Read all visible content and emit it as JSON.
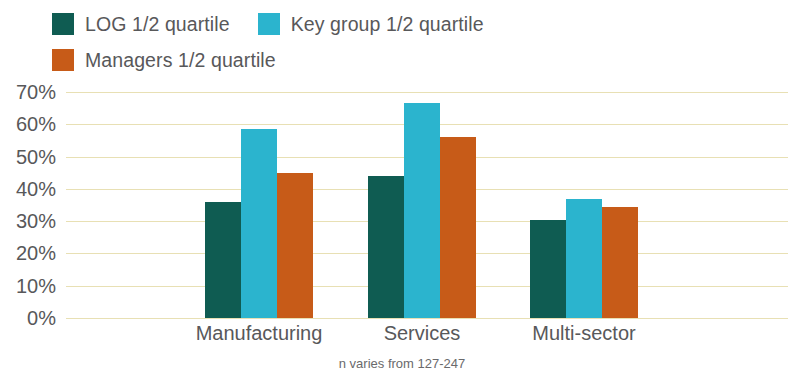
{
  "chart_data": {
    "type": "bar",
    "title": "",
    "subtitle": "",
    "xlabel": "",
    "ylabel": "",
    "categories": [
      "Manufacturing",
      "Services",
      "Multi-sector"
    ],
    "series": [
      {
        "name": "LOG 1/2 quartile",
        "color": "#0F5C52",
        "values": [
          36,
          44,
          30.5
        ]
      },
      {
        "name": "Key group 1/2 quartile",
        "color": "#2BB4CE",
        "values": [
          58.5,
          66.5,
          37
        ]
      },
      {
        "name": "Managers 1/2 quartile",
        "color": "#C75B18",
        "values": [
          45,
          56,
          34.5
        ]
      }
    ],
    "ylim": [
      0,
      70
    ],
    "ytick_values": [
      70,
      60,
      50,
      40,
      30,
      20,
      10,
      0
    ],
    "ytick_labels": [
      "70%",
      "60%",
      "50%",
      "40%",
      "30%",
      "20%",
      "10%",
      "0%"
    ],
    "grid": true,
    "grid_color": "#E8E0B4",
    "legend_position": "top-left",
    "annotation": "n varies from 127-247",
    "background_color": "#FFFFFF",
    "text_color": "#58585A"
  },
  "legend": {
    "rows": [
      [
        {
          "label": "LOG 1/2 quartile",
          "color": "#0F5C52",
          "swatch_name": "legend-swatch-log"
        },
        {
          "label": "Key group 1/2 quartile",
          "color": "#2BB4CE",
          "swatch_name": "legend-swatch-key-group"
        }
      ],
      [
        {
          "label": "Managers 1/2 quartile",
          "color": "#C75B18",
          "swatch_name": "legend-swatch-managers"
        }
      ]
    ]
  },
  "footnote": {
    "text": "n varies from 127-247"
  }
}
